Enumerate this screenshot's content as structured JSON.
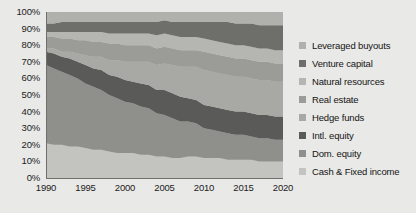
{
  "chart_data": {
    "type": "area",
    "title": "",
    "subtitle": "",
    "xlabel": "",
    "ylabel": "",
    "stacked": true,
    "normalized": "100%",
    "grid": true,
    "legend_position": "right",
    "xlim": [
      1990,
      2020
    ],
    "ylim": [
      0,
      100
    ],
    "x": [
      1990,
      1991,
      1992,
      1993,
      1994,
      1995,
      1996,
      1997,
      1998,
      1999,
      2000,
      2001,
      2002,
      2003,
      2004,
      2005,
      2006,
      2007,
      2008,
      2009,
      2010,
      2011,
      2012,
      2013,
      2014,
      2015,
      2016,
      2017,
      2018,
      2019,
      2020
    ],
    "ytick_labels": [
      "100%",
      "90%",
      "80%",
      "70%",
      "60%",
      "50%",
      "40%",
      "30%",
      "20%",
      "10%",
      "0%"
    ],
    "ytick_values": [
      100,
      90,
      80,
      70,
      60,
      50,
      40,
      30,
      20,
      10,
      0
    ],
    "xtick_labels": [
      "1990",
      "1995",
      "2000",
      "2005",
      "2010",
      "2015",
      "2020"
    ],
    "xtick_values": [
      1990,
      1995,
      2000,
      2005,
      2010,
      2015,
      2020
    ],
    "series": [
      {
        "name": "Cash & Fixed income",
        "color": "#c3c3bf",
        "values": [
          21,
          20,
          20,
          19,
          19,
          18,
          17,
          17,
          16,
          15,
          15,
          15,
          14,
          14,
          13,
          13,
          12,
          12,
          13,
          13,
          12,
          12,
          12,
          11,
          11,
          11,
          11,
          10,
          10,
          10,
          10
        ]
      },
      {
        "name": "Dom. equity",
        "color": "#8f8f8c",
        "values": [
          47,
          46,
          44,
          43,
          41,
          39,
          38,
          36,
          34,
          33,
          31,
          30,
          29,
          28,
          26,
          25,
          24,
          22,
          21,
          20,
          18,
          17,
          16,
          16,
          15,
          15,
          14,
          14,
          14,
          13,
          13
        ]
      },
      {
        "name": "Intl. equity",
        "color": "#5a5a58",
        "values": [
          8,
          9,
          9,
          10,
          10,
          11,
          11,
          12,
          12,
          13,
          13,
          13,
          14,
          14,
          14,
          15,
          15,
          15,
          14,
          14,
          14,
          14,
          14,
          14,
          14,
          14,
          14,
          14,
          14,
          14,
          14
        ]
      },
      {
        "name": "Hedge funds",
        "color": "#a8a8a4",
        "values": [
          2,
          3,
          3,
          4,
          5,
          6,
          7,
          8,
          9,
          10,
          11,
          12,
          13,
          14,
          15,
          16,
          17,
          18,
          19,
          20,
          21,
          21,
          21,
          21,
          21,
          21,
          21,
          21,
          21,
          21,
          21
        ]
      },
      {
        "name": "Real estate",
        "color": "#9b9b97",
        "values": [
          7,
          7,
          8,
          8,
          8,
          9,
          9,
          9,
          10,
          10,
          10,
          10,
          10,
          10,
          10,
          10,
          10,
          10,
          10,
          10,
          11,
          11,
          11,
          11,
          11,
          11,
          11,
          11,
          11,
          11,
          11
        ]
      },
      {
        "name": "Natural resources",
        "color": "#b5b5b1",
        "values": [
          3,
          3,
          4,
          4,
          5,
          5,
          6,
          6,
          6,
          6,
          7,
          7,
          7,
          7,
          8,
          8,
          8,
          8,
          8,
          8,
          8,
          8,
          8,
          8,
          8,
          8,
          8,
          8,
          8,
          8,
          8
        ]
      },
      {
        "name": "Venture capital",
        "color": "#6e6e6b",
        "values": [
          5,
          5,
          6,
          6,
          6,
          6,
          6,
          6,
          7,
          7,
          7,
          7,
          7,
          7,
          8,
          8,
          8,
          9,
          9,
          9,
          10,
          11,
          12,
          13,
          13,
          13,
          14,
          14,
          14,
          15,
          15
        ]
      },
      {
        "name": "Leveraged buyouts",
        "color": "#b0b0ac",
        "values": [
          7,
          7,
          6,
          6,
          6,
          6,
          6,
          6,
          6,
          6,
          6,
          6,
          6,
          6,
          6,
          5,
          6,
          6,
          6,
          6,
          6,
          6,
          6,
          6,
          7,
          7,
          7,
          8,
          8,
          8,
          8
        ]
      }
    ],
    "legend_order": [
      "Leveraged buyouts",
      "Venture capital",
      "Natural resources",
      "Real estate",
      "Hedge funds",
      "Intl. equity",
      "Dom. equity",
      "Cash & Fixed income"
    ]
  },
  "colors": {
    "background": "#e9e9e7",
    "plot_background": "#cfcfcb",
    "axis": "#6f6f6c",
    "text": "#141414"
  }
}
